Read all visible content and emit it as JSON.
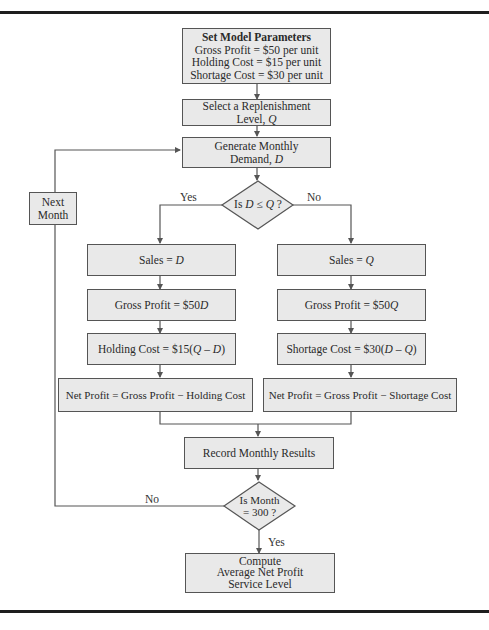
{
  "diagram": {
    "type": "flowchart",
    "colors": {
      "box_fill": "#e9e9e9",
      "box_border": "#555555",
      "line": "#555555",
      "rule": "#1e1e1e"
    },
    "nodes": {
      "set_params": {
        "title": "Set Model Parameters",
        "lines": [
          "Gross Profit = $50 per unit",
          "Holding Cost = $15 per unit",
          "Shortage Cost = $30 per unit"
        ]
      },
      "select_q": {
        "line1": "Select a Replenishment",
        "line2_prefix": "Level, ",
        "line2_var": "Q"
      },
      "generate_d": {
        "line1": "Generate Monthly",
        "line2_prefix": "Demand, ",
        "line2_var": "D"
      },
      "decision_dq": {
        "prefix": "Is ",
        "var1": "D",
        "op": " ≤ ",
        "var2": "Q",
        "suffix": " ?"
      },
      "next_month": {
        "line1": "Next",
        "line2": "Month"
      },
      "sales_d": {
        "prefix": "Sales = ",
        "var": "D"
      },
      "sales_q": {
        "prefix": "Sales = ",
        "var": "Q"
      },
      "gp_d": {
        "prefix": "Gross Profit = $50",
        "var": "D"
      },
      "gp_q": {
        "prefix": "Gross Profit = $50",
        "var": "Q"
      },
      "holding": {
        "prefix": "Holding Cost = $15(",
        "var1": "Q",
        "op": " – ",
        "var2": "D",
        "suffix": ")"
      },
      "shortage": {
        "prefix": "Shortage Cost = $30(",
        "var1": "D",
        "op": " – ",
        "var2": "Q",
        "suffix": ")"
      },
      "net_left": "Net Profit = Gross Profit − Holding Cost",
      "net_right": "Net Profit = Gross Profit − Shortage Cost",
      "record": "Record Monthly Results",
      "decision_month": {
        "line1": "Is Month",
        "line2": "= 300 ?"
      },
      "compute": {
        "lines": [
          "Compute",
          "Average Net Profit",
          "Service Level"
        ]
      }
    },
    "edge_labels": {
      "dq_yes": "Yes",
      "dq_no": "No",
      "month_no": "No",
      "month_yes": "Yes"
    }
  }
}
